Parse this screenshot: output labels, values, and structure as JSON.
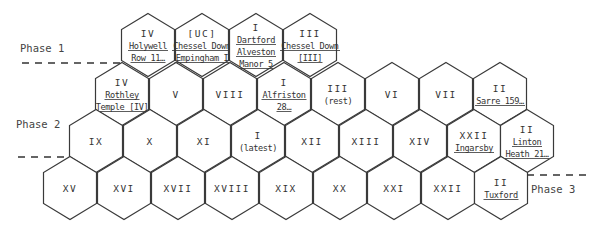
{
  "diagram": {
    "geometry": {
      "col_step": 54,
      "hex_width": 53,
      "hex_height": 63,
      "shoulder": 16
    },
    "phases": [
      {
        "label": "Phase 1",
        "label_x": 20,
        "label_y": 52,
        "line": [
          22,
          63,
          122,
          63
        ]
      },
      {
        "label": "Phase 2",
        "label_x": 16,
        "label_y": 128,
        "line": [
          18,
          157,
          70,
          157
        ]
      },
      {
        "label": "Phase 3",
        "label_x": 531,
        "label_y": 193,
        "line": [
          527,
          175,
          591,
          175
        ]
      }
    ],
    "rows": [
      {
        "cy": 45,
        "hexes": [
          {
            "cx": 148,
            "lines": [
              {
                "text": "IV",
                "ul": false
              },
              {
                "text": "Holywell",
                "ul": true
              },
              {
                "text": "Row 11…",
                "ul": true
              }
            ]
          },
          {
            "cx": 202,
            "lines": [
              {
                "text": "[UC]",
                "ul": false
              },
              {
                "text": "Chessel Down",
                "ul": true
              },
              {
                "text": "Empingham I",
                "ul": true
              }
            ]
          },
          {
            "cx": 256,
            "lines": [
              {
                "text": "I",
                "ul": false
              },
              {
                "text": "Dartford",
                "ul": true
              },
              {
                "text": "Alveston",
                "ul": true
              },
              {
                "text": "Manor 5",
                "ul": true
              }
            ]
          },
          {
            "cx": 310,
            "lines": [
              {
                "text": "III",
                "ul": false
              },
              {
                "text": "Chessel Down",
                "ul": true
              },
              {
                "text": "[III]",
                "ul": true
              }
            ]
          }
        ]
      },
      {
        "cy": 94,
        "hexes": [
          {
            "cx": 122,
            "lines": [
              {
                "text": "IV",
                "ul": false
              },
              {
                "text": "Rothley",
                "ul": true
              },
              {
                "text": "Temple [IV]",
                "ul": true
              }
            ]
          },
          {
            "cx": 176,
            "lines": [
              {
                "text": "V",
                "ul": false
              }
            ]
          },
          {
            "cx": 230,
            "lines": [
              {
                "text": "VIII",
                "ul": false
              }
            ]
          },
          {
            "cx": 284,
            "lines": [
              {
                "text": "I",
                "ul": false
              },
              {
                "text": "Alfriston",
                "ul": true
              },
              {
                "text": "28…",
                "ul": true
              }
            ]
          },
          {
            "cx": 338,
            "lines": [
              {
                "text": "III",
                "ul": false
              },
              {
                "text": "(rest)",
                "ul": false
              }
            ]
          },
          {
            "cx": 392,
            "lines": [
              {
                "text": "VI",
                "ul": false
              }
            ]
          },
          {
            "cx": 446,
            "lines": [
              {
                "text": "VII",
                "ul": false
              }
            ]
          },
          {
            "cx": 500,
            "lines": [
              {
                "text": "II",
                "ul": false
              },
              {
                "text": "Sarre 159…",
                "ul": true
              }
            ]
          }
        ]
      },
      {
        "cy": 141,
        "hexes": [
          {
            "cx": 96,
            "lines": [
              {
                "text": "IX",
                "ul": false
              }
            ]
          },
          {
            "cx": 150,
            "lines": [
              {
                "text": "X",
                "ul": false
              }
            ]
          },
          {
            "cx": 204,
            "lines": [
              {
                "text": "XI",
                "ul": false
              }
            ]
          },
          {
            "cx": 258,
            "lines": [
              {
                "text": "I",
                "ul": false
              },
              {
                "text": "(latest)",
                "ul": false
              }
            ]
          },
          {
            "cx": 312,
            "lines": [
              {
                "text": "XII",
                "ul": false
              }
            ]
          },
          {
            "cx": 366,
            "lines": [
              {
                "text": "XIII",
                "ul": false
              }
            ]
          },
          {
            "cx": 420,
            "lines": [
              {
                "text": "XIV",
                "ul": false
              }
            ]
          },
          {
            "cx": 474,
            "lines": [
              {
                "text": "XXII",
                "ul": false
              },
              {
                "text": "Ingarsby",
                "ul": true
              }
            ]
          },
          {
            "cx": 527,
            "lines": [
              {
                "text": "II",
                "ul": false
              },
              {
                "text": "Linton",
                "ul": true
              },
              {
                "text": "Heath 21…",
                "ul": true
              }
            ]
          }
        ]
      },
      {
        "cy": 188,
        "hexes": [
          {
            "cx": 70,
            "lines": [
              {
                "text": "XV",
                "ul": false
              }
            ]
          },
          {
            "cx": 124,
            "lines": [
              {
                "text": "XVI",
                "ul": false
              }
            ]
          },
          {
            "cx": 178,
            "lines": [
              {
                "text": "XVII",
                "ul": false
              }
            ]
          },
          {
            "cx": 232,
            "lines": [
              {
                "text": "XVIII",
                "ul": false
              }
            ]
          },
          {
            "cx": 286,
            "lines": [
              {
                "text": "XIX",
                "ul": false
              }
            ]
          },
          {
            "cx": 340,
            "lines": [
              {
                "text": "XX",
                "ul": false
              }
            ]
          },
          {
            "cx": 394,
            "lines": [
              {
                "text": "XXI",
                "ul": false
              }
            ]
          },
          {
            "cx": 448,
            "lines": [
              {
                "text": "XXII",
                "ul": false
              }
            ]
          },
          {
            "cx": 501,
            "lines": [
              {
                "text": "II",
                "ul": false
              },
              {
                "text": "Tuxford",
                "ul": true
              }
            ]
          }
        ]
      }
    ]
  }
}
